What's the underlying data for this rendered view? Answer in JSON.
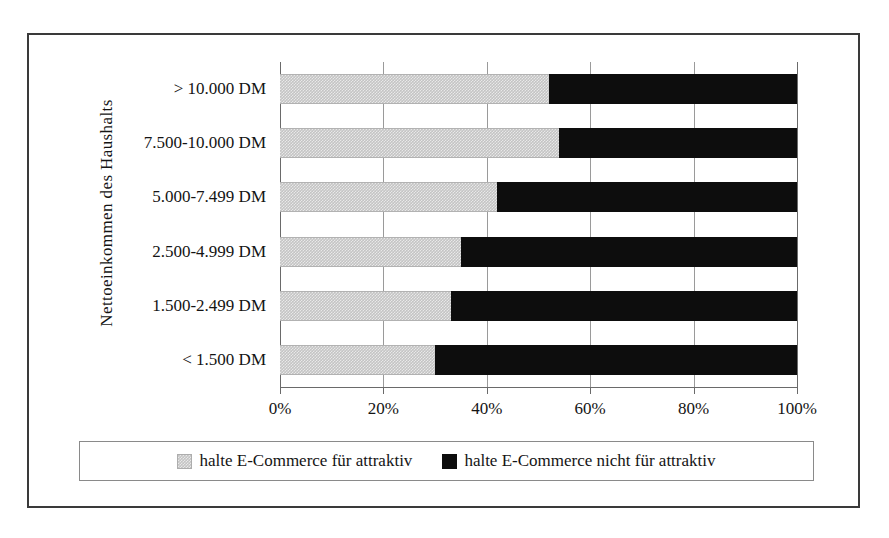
{
  "chart_data": {
    "type": "bar",
    "orientation": "horizontal",
    "stacked": true,
    "normalized_percent": true,
    "title": "",
    "xlabel": "",
    "ylabel": "Nettoeinkommen des Haushalts",
    "xlim": [
      0,
      100
    ],
    "grid": true,
    "legend_position": "bottom",
    "xticks": [
      "0%",
      "20%",
      "40%",
      "60%",
      "80%",
      "100%"
    ],
    "xtick_values": [
      0,
      20,
      40,
      60,
      80,
      100
    ],
    "categories": [
      "> 10.000 DM",
      "7.500-10.000 DM",
      "5.000-7.499 DM",
      "2.500-4.999 DM",
      "1.500-2.499 DM",
      "< 1.500 DM"
    ],
    "series": [
      {
        "name": "halte E-Commerce für attraktiv",
        "color": "#c4c4c4",
        "values": [
          52,
          54,
          42,
          35,
          33,
          30
        ]
      },
      {
        "name": "halte E-Commerce nicht für attraktiv",
        "color": "#0d0d0d",
        "values": [
          48,
          46,
          58,
          65,
          67,
          70
        ]
      }
    ]
  },
  "legend": {
    "entries": [
      {
        "label": "halte E-Commerce für attraktiv",
        "swatch": "grey"
      },
      {
        "label": "halte E-Commerce nicht für attraktiv",
        "swatch": "black"
      }
    ]
  },
  "axis": {
    "y_title": "Nettoeinkommen des Haushalts"
  }
}
